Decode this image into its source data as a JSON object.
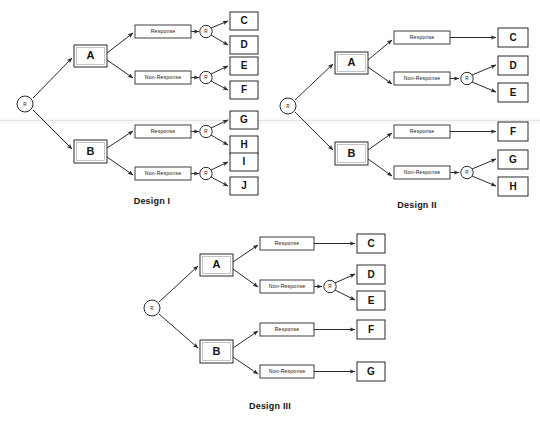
{
  "figure": {
    "background_color": "#ffffff",
    "line_color": "#2b2b2b",
    "text_color": "#151515",
    "node_labels": {
      "root": "R",
      "randomizer": "R",
      "arm_a": "A",
      "arm_b": "B",
      "response": "Response",
      "non_response": "Non-Response"
    }
  },
  "designs": [
    {
      "id": "design-1",
      "caption": "Design I",
      "root": "R",
      "branches": [
        {
          "arm": "A",
          "paths": [
            {
              "label": "Response",
              "rerandomized": true,
              "randomizer": "R",
              "outcomes": [
                "C",
                "D"
              ]
            },
            {
              "label": "Non-Response",
              "rerandomized": true,
              "randomizer": "R",
              "outcomes": [
                "E",
                "F"
              ]
            }
          ]
        },
        {
          "arm": "B",
          "paths": [
            {
              "label": "Response",
              "rerandomized": true,
              "randomizer": "R",
              "outcomes": [
                "G",
                "H"
              ]
            },
            {
              "label": "Non-Response",
              "rerandomized": true,
              "randomizer": "R",
              "outcomes": [
                "I",
                "J"
              ]
            }
          ]
        }
      ]
    },
    {
      "id": "design-2",
      "caption": "Design II",
      "root": "R",
      "branches": [
        {
          "arm": "A",
          "paths": [
            {
              "label": "Response",
              "rerandomized": false,
              "randomizer": null,
              "outcomes": [
                "C"
              ]
            },
            {
              "label": "Non-Response",
              "rerandomized": true,
              "randomizer": "R",
              "outcomes": [
                "D",
                "E"
              ]
            }
          ]
        },
        {
          "arm": "B",
          "paths": [
            {
              "label": "Response",
              "rerandomized": false,
              "randomizer": null,
              "outcomes": [
                "F"
              ]
            },
            {
              "label": "Non-Response",
              "rerandomized": true,
              "randomizer": "R",
              "outcomes": [
                "G",
                "H"
              ]
            }
          ]
        }
      ]
    },
    {
      "id": "design-3",
      "caption": "Design III",
      "root": "R",
      "branches": [
        {
          "arm": "A",
          "paths": [
            {
              "label": "Response",
              "rerandomized": false,
              "randomizer": null,
              "outcomes": [
                "C"
              ]
            },
            {
              "label": "Non-Response",
              "rerandomized": true,
              "randomizer": "R",
              "outcomes": [
                "D",
                "E"
              ]
            }
          ]
        },
        {
          "arm": "B",
          "paths": [
            {
              "label": "Response",
              "rerandomized": false,
              "randomizer": null,
              "outcomes": [
                "F"
              ]
            },
            {
              "label": "Non-Response",
              "rerandomized": false,
              "randomizer": null,
              "outcomes": [
                "G"
              ]
            }
          ]
        }
      ]
    }
  ]
}
